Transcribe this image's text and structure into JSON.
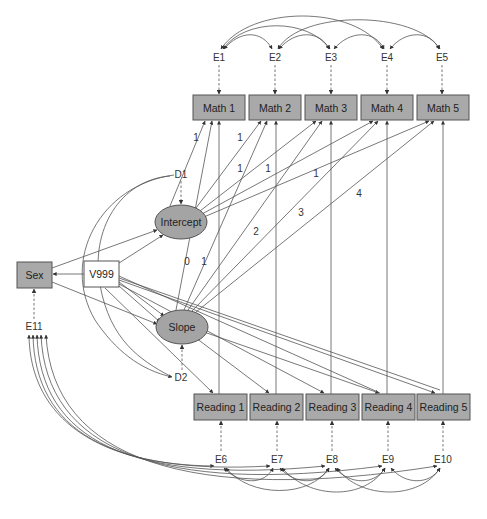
{
  "diagram": {
    "type": "path-diagram",
    "observed_math": [
      {
        "id": "math1",
        "label": "Math 1",
        "x": 193,
        "y": 95,
        "w": 52,
        "h": 25
      },
      {
        "id": "math2",
        "label": "Math 2",
        "x": 249,
        "y": 95,
        "w": 52,
        "h": 25
      },
      {
        "id": "math3",
        "label": "Math 3",
        "x": 305,
        "y": 95,
        "w": 52,
        "h": 25
      },
      {
        "id": "math4",
        "label": "Math 4",
        "x": 361,
        "y": 95,
        "w": 52,
        "h": 25
      },
      {
        "id": "math5",
        "label": "Math 5",
        "x": 417,
        "y": 95,
        "w": 52,
        "h": 25
      }
    ],
    "observed_reading": [
      {
        "id": "read1",
        "label": "Reading 1",
        "x": 194,
        "y": 394,
        "w": 53,
        "h": 26
      },
      {
        "id": "read2",
        "label": "Reading 2",
        "x": 250,
        "y": 394,
        "w": 53,
        "h": 26
      },
      {
        "id": "read3",
        "label": "Reading 3",
        "x": 306,
        "y": 394,
        "w": 53,
        "h": 26
      },
      {
        "id": "read4",
        "label": "Reading 4",
        "x": 362,
        "y": 394,
        "w": 53,
        "h": 26
      },
      {
        "id": "read5",
        "label": "Reading 5",
        "x": 417,
        "y": 394,
        "w": 53,
        "h": 26
      }
    ],
    "math_errors": [
      {
        "label": "E1",
        "x": 219,
        "y": 57
      },
      {
        "label": "E2",
        "x": 275,
        "y": 57
      },
      {
        "label": "E3",
        "x": 331,
        "y": 57
      },
      {
        "label": "E4",
        "x": 387,
        "y": 57
      },
      {
        "label": "E5",
        "x": 442,
        "y": 57
      }
    ],
    "reading_errors": [
      {
        "label": "E6",
        "x": 221,
        "y": 459
      },
      {
        "label": "E7",
        "x": 277,
        "y": 459
      },
      {
        "label": "E8",
        "x": 332,
        "y": 459
      },
      {
        "label": "E9",
        "x": 388,
        "y": 459
      },
      {
        "label": "E10",
        "x": 443,
        "y": 459
      }
    ],
    "latents": [
      {
        "id": "intercept",
        "label": "Intercept",
        "cx": 181,
        "cy": 222,
        "rx": 26,
        "ry": 17
      },
      {
        "id": "slope",
        "label": "Slope",
        "cx": 182,
        "cy": 327,
        "rx": 26,
        "ry": 17
      }
    ],
    "disturbances": [
      {
        "label": "D1",
        "x": 181,
        "y": 174
      },
      {
        "label": "D2",
        "x": 181,
        "y": 377
      }
    ],
    "covariates": {
      "sex": {
        "label": "Sex",
        "x": 17,
        "y": 262,
        "w": 35,
        "h": 26
      },
      "v999": {
        "label": "V999",
        "x": 84,
        "y": 261,
        "w": 35,
        "h": 26
      },
      "e11": {
        "label": "E11",
        "x": 34,
        "y": 326
      }
    },
    "loading_labels": [
      {
        "text": "1",
        "x": 196,
        "y": 137
      },
      {
        "text": "1",
        "x": 240,
        "y": 137
      },
      {
        "text": "1",
        "x": 240,
        "y": 168
      },
      {
        "text": "1",
        "x": 268,
        "y": 168
      },
      {
        "text": "1",
        "x": 316,
        "y": 173
      },
      {
        "text": "4",
        "x": 359,
        "y": 193
      },
      {
        "text": "3",
        "x": 301,
        "y": 212
      },
      {
        "text": "2",
        "x": 256,
        "y": 231
      },
      {
        "text": "0",
        "x": 187,
        "y": 261
      },
      {
        "text": "1",
        "x": 204,
        "y": 261
      }
    ]
  }
}
